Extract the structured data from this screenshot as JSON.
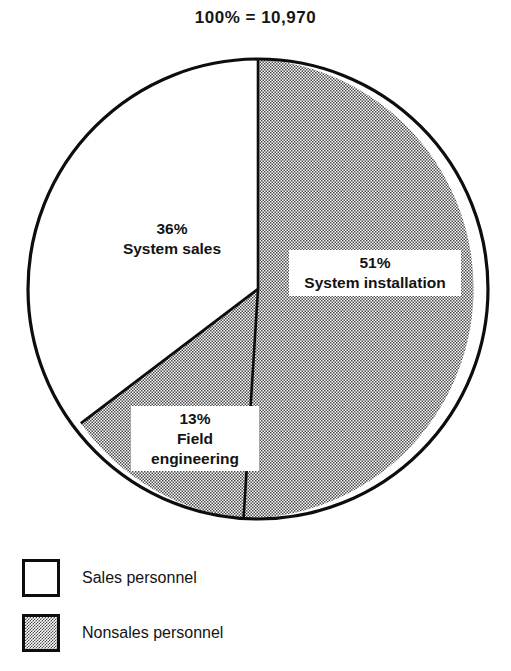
{
  "chart_data": {
    "type": "pie",
    "title": "100% = 10,970",
    "total": 10970,
    "total_label": "100% = 10,970",
    "start_angle_deg": 0,
    "direction": "clockwise",
    "categories": [
      "System installation",
      "Field engineering",
      "System sales"
    ],
    "values": [
      51,
      13,
      36
    ],
    "value_unit": "percent",
    "slices": [
      {
        "label": "System installation",
        "percent_text": "51%",
        "value": 51,
        "group": "Nonsales personnel",
        "fill": "stipple",
        "start_deg": 0,
        "end_deg": 183.6
      },
      {
        "label": "Field engineering",
        "percent_text": "13%",
        "value": 13,
        "group": "Nonsales personnel",
        "fill": "stipple",
        "start_deg": 183.6,
        "end_deg": 230.4
      },
      {
        "label": "System sales",
        "percent_text": "36%",
        "value": 36,
        "group": "Sales personnel",
        "fill": "white",
        "start_deg": 230.4,
        "end_deg": 360
      }
    ],
    "legend": {
      "position": "bottom-left",
      "entries": [
        {
          "label": "Sales personnel",
          "swatch": "white"
        },
        {
          "label": "Nonsales personnel",
          "swatch": "stipple"
        }
      ]
    },
    "colors": {
      "outline": "#0d0d0d",
      "white_fill": "#ffffff",
      "stipple_ink": "#4a4a4a",
      "text": "#131313",
      "background": "#ffffff"
    },
    "xlabel": "",
    "ylabel": "",
    "grid": false
  }
}
